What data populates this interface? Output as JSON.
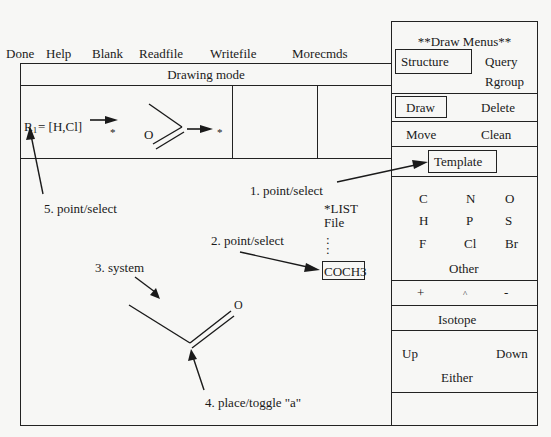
{
  "top_menu": {
    "items": [
      "Done",
      "Help",
      "Blank",
      "Readfile",
      "Writefile",
      "Morecmds"
    ]
  },
  "mode_bar": {
    "label": "Drawing mode"
  },
  "rgroup_definition": {
    "r_label": "R",
    "r_subscript": "1",
    "r_values": "= [H,Cl]",
    "star1": "*",
    "oxygen": "O",
    "star2": "*"
  },
  "canvas": {
    "callouts": {
      "c1": "1. point/select",
      "c2": "2. point/select",
      "c3": "3. system",
      "c4": "4. place/toggle \"a\"",
      "c5": "5. point/select"
    },
    "template_list": {
      "header": "*LIST",
      "file": "File",
      "dots": ":",
      "selected": "COCH3"
    },
    "molecule": {
      "oxygen": "O"
    }
  },
  "draw_menus": {
    "title": "**Draw Menus**",
    "structure": "Structure",
    "query": "Query",
    "rgroup": "Rgroup",
    "draw": "Draw",
    "delete": "Delete",
    "move": "Move",
    "clean": "Clean",
    "template": "Template",
    "atoms": [
      "C",
      "N",
      "O",
      "H",
      "P",
      "S",
      "F",
      "Cl",
      "Br"
    ],
    "other": "Other",
    "charges": [
      "+",
      "^",
      "-"
    ],
    "isotope": "Isotope",
    "up": "Up",
    "down": "Down",
    "either": "Either"
  }
}
